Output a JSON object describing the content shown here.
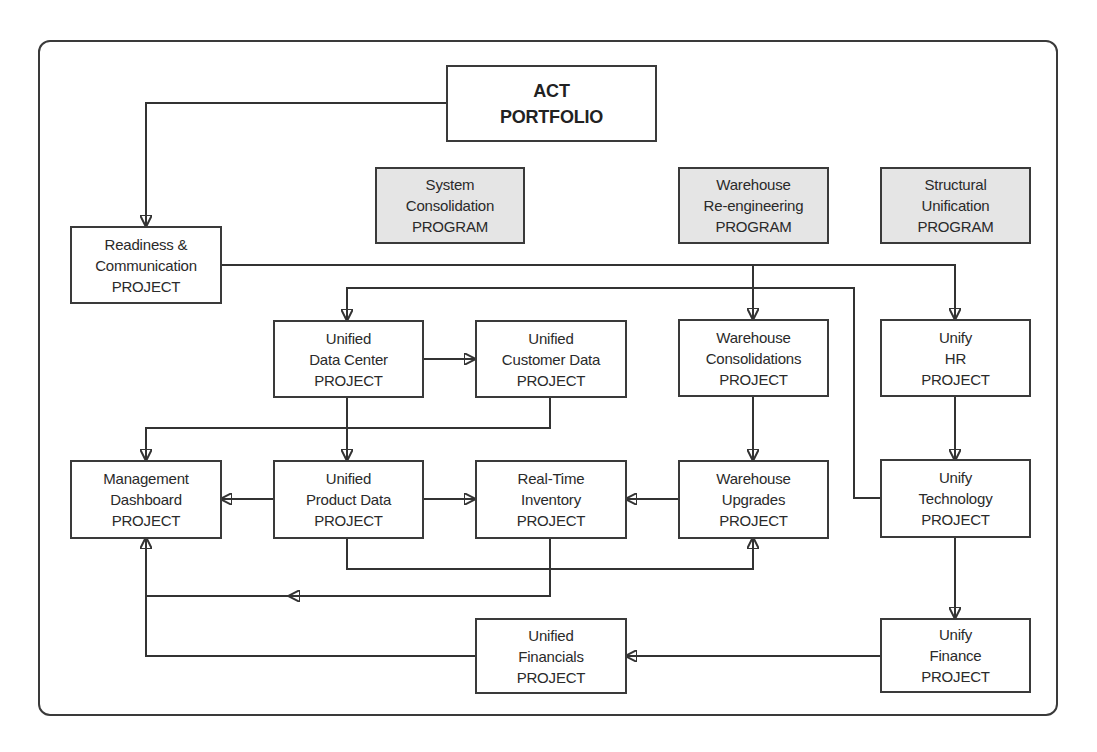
{
  "diagram": {
    "root": {
      "line1": "ACT",
      "line2": "PORTFOLIO"
    },
    "programs": [
      {
        "line1": "System",
        "line2": "Consolidation",
        "line3": "PROGRAM"
      },
      {
        "line1": "Warehouse",
        "line2": "Re-engineering",
        "line3": "PROGRAM"
      },
      {
        "line1": "Structural",
        "line2": "Unification",
        "line3": "PROGRAM"
      }
    ],
    "projects": {
      "readiness": {
        "line1": "Readiness &",
        "line2": "Communication",
        "line3": "PROJECT"
      },
      "data_center": {
        "line1": "Unified",
        "line2": "Data Center",
        "line3": "PROJECT"
      },
      "customer_data": {
        "line1": "Unified",
        "line2": "Customer Data",
        "line3": "PROJECT"
      },
      "warehouse_consolidations": {
        "line1": "Warehouse",
        "line2": "Consolidations",
        "line3": "PROJECT"
      },
      "unify_hr": {
        "line1": "Unify",
        "line2": "HR",
        "line3": "PROJECT"
      },
      "management_dashboard": {
        "line1": "Management",
        "line2": "Dashboard",
        "line3": "PROJECT"
      },
      "product_data": {
        "line1": "Unified",
        "line2": "Product Data",
        "line3": "PROJECT"
      },
      "realtime_inventory": {
        "line1": "Real-Time",
        "line2": "Inventory",
        "line3": "PROJECT"
      },
      "warehouse_upgrades": {
        "line1": "Warehouse",
        "line2": "Upgrades",
        "line3": "PROJECT"
      },
      "unify_technology": {
        "line1": "Unify",
        "line2": "Technology",
        "line3": "PROJECT"
      },
      "unified_financials": {
        "line1": "Unified",
        "line2": "Financials",
        "line3": "PROJECT"
      },
      "unify_finance": {
        "line1": "Unify",
        "line2": "Finance",
        "line3": "PROJECT"
      }
    },
    "edges": [
      {
        "from": "ACT PORTFOLIO",
        "to": "Readiness & Communication PROJECT"
      },
      {
        "from": "Readiness & Communication PROJECT",
        "to": "Warehouse Consolidations PROJECT"
      },
      {
        "from": "Readiness & Communication PROJECT",
        "to": "Unify HR PROJECT"
      },
      {
        "from": "Unify Technology PROJECT",
        "to": "Unified Data Center PROJECT"
      },
      {
        "from": "Unified Data Center PROJECT",
        "to": "Unified Customer Data PROJECT"
      },
      {
        "from": "Unified Data Center PROJECT",
        "to": "Unified Product Data PROJECT"
      },
      {
        "from": "Unified Customer Data PROJECT",
        "to": "Management Dashboard PROJECT"
      },
      {
        "from": "Warehouse Consolidations PROJECT",
        "to": "Warehouse Upgrades PROJECT"
      },
      {
        "from": "Unify HR PROJECT",
        "to": "Unify Technology PROJECT"
      },
      {
        "from": "Unified Product Data PROJECT",
        "to": "Management Dashboard PROJECT"
      },
      {
        "from": "Unified Product Data PROJECT",
        "to": "Real-Time Inventory PROJECT"
      },
      {
        "from": "Unified Product Data PROJECT",
        "to": "Warehouse Upgrades PROJECT"
      },
      {
        "from": "Warehouse Upgrades PROJECT",
        "to": "Real-Time Inventory PROJECT"
      },
      {
        "from": "Real-Time Inventory PROJECT",
        "to": "Management Dashboard PROJECT"
      },
      {
        "from": "Unify Technology PROJECT",
        "to": "Unify Finance PROJECT"
      },
      {
        "from": "Unify Finance PROJECT",
        "to": "Unified Financials PROJECT"
      },
      {
        "from": "Unified Financials PROJECT",
        "to": "Management Dashboard PROJECT"
      }
    ]
  }
}
